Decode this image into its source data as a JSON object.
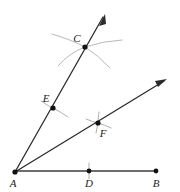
{
  "figure": {
    "background_color": "#ffffff",
    "line_color": "#2b2b2b",
    "base_color": "#6d6d6d",
    "arc_color": "#b9b9b9",
    "point_color": "#111111"
  },
  "points": [
    {
      "id": "A",
      "label": "A",
      "x": 15,
      "y": 172,
      "label_x": 13,
      "label_y": 187,
      "dot": true
    },
    {
      "id": "B",
      "label": "B",
      "x": 156,
      "y": 171,
      "label_x": 154,
      "label_y": 187,
      "dot": true
    },
    {
      "id": "C",
      "label": "C",
      "x": 85,
      "y": 47,
      "label_x": 76,
      "label_y": 41,
      "dot": true
    },
    {
      "id": "D",
      "label": "D",
      "x": 89,
      "y": 171,
      "label_x": 86,
      "label_y": 187,
      "dot": true
    },
    {
      "id": "E",
      "label": "E",
      "x": 53,
      "y": 108,
      "label_x": 44,
      "label_y": 102,
      "dot": true
    },
    {
      "id": "F",
      "label": "F",
      "x": 98,
      "y": 123,
      "label_x": 100,
      "label_y": 137,
      "dot": true
    }
  ],
  "segments": [
    {
      "id": "base-ab",
      "label": "AB",
      "x1": 15,
      "y1": 171,
      "x2": 156,
      "y2": 171
    }
  ],
  "rays": [
    {
      "id": "ray-ac",
      "label": "AC",
      "x1": 15,
      "y1": 172,
      "x2": 105,
      "y2": 14
    },
    {
      "id": "ray-af",
      "label": "AF",
      "x1": 15,
      "y1": 172,
      "x2": 167,
      "y2": 79
    }
  ],
  "arrows": [
    {
      "id": "arrow-ac",
      "tip_x": 105,
      "tip_y": 14,
      "angle": -60.3
    },
    {
      "id": "arrow-af",
      "tip_x": 167,
      "tip_y": 79,
      "angle": -31.4
    }
  ],
  "arcs": [
    {
      "id": "arc-c-left",
      "d": "M 52 34 Q 72 40 85 47 Q 98 55 110 68"
    },
    {
      "id": "arc-c-right",
      "d": "M 122 40 Q 103 41 85 47 Q 69 53 58 66"
    },
    {
      "id": "tick-e",
      "d": "M 41 101 Q 50 107 53 108 Q 59 111 68 117"
    },
    {
      "id": "tick-f",
      "d": "M 86 119 Q 93 122 98 123 Q 105 125 111 128"
    },
    {
      "id": "tick-f-cross",
      "d": "M 99 112 Q 98 118 98 123 Q 97 128 96 133"
    },
    {
      "id": "tick-d",
      "d": "M 89 163 Q 89 167 89 171 Q 89 175 89 179"
    }
  ],
  "labels": {
    "a": "A",
    "b": "B",
    "c": "C",
    "d": "D",
    "e": "E",
    "f": "F"
  }
}
